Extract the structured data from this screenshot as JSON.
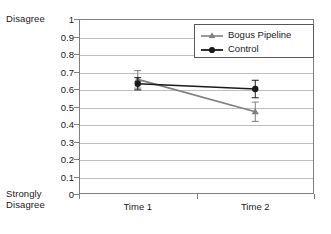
{
  "chart_data": {
    "type": "line",
    "title": "",
    "xlabel": "",
    "ylabel": "",
    "categories": [
      "Time 1",
      "Time 2"
    ],
    "ylim": [
      0,
      1
    ],
    "ytick_step": 0.1,
    "yticks": [
      "1",
      "0.9",
      "0.8",
      "0.7",
      "0.6",
      "0.5",
      "0.4",
      "0.3",
      "0.2",
      "0.1",
      "0"
    ],
    "grid": true,
    "legend_position": "top-right",
    "y_axis_top_label": "Disagree",
    "y_axis_bottom_label": "Strongly\nDisagree",
    "series": [
      {
        "name": "Bogus Pipeline",
        "color": "#7f7f7f",
        "marker": "triangle",
        "values": [
          0.655,
          0.47
        ],
        "errors": [
          0.05,
          0.055
        ]
      },
      {
        "name": "Control",
        "color": "#1a1a1a",
        "marker": "circle",
        "values": [
          0.63,
          0.6
        ],
        "errors": [
          0.035,
          0.05
        ]
      }
    ]
  },
  "legend": {
    "items": [
      {
        "label": "Bogus Pipeline"
      },
      {
        "label": "Control"
      }
    ]
  }
}
